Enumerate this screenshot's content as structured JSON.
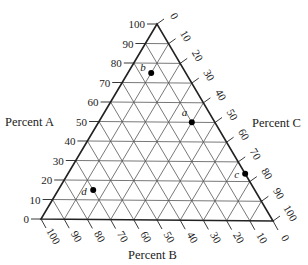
{
  "diagram": {
    "type": "ternary",
    "vertices": {
      "top": "100% A",
      "bottom_left": "100% B",
      "bottom_right": "100% C"
    },
    "axes": {
      "A": {
        "title": "Percent A",
        "ticks": [
          "0",
          "10",
          "20",
          "30",
          "40",
          "50",
          "60",
          "70",
          "80",
          "90",
          "100"
        ]
      },
      "B": {
        "title": "Percent B",
        "ticks": [
          "100",
          "90",
          "80",
          "70",
          "60",
          "50",
          "40",
          "30",
          "20",
          "10",
          "0"
        ]
      },
      "C": {
        "title": "Percent C",
        "ticks": [
          "0",
          "10",
          "20",
          "30",
          "40",
          "50",
          "60",
          "70",
          "80",
          "90",
          "100"
        ]
      }
    },
    "grid_step": 10,
    "points": [
      {
        "label": "a",
        "A": 50,
        "B": 10,
        "C": 40
      },
      {
        "label": "b",
        "A": 75,
        "B": 15,
        "C": 10
      },
      {
        "label": "c",
        "A": 24,
        "B": 0,
        "C": 76
      },
      {
        "label": "d",
        "A": 15,
        "B": 70,
        "C": 15
      }
    ],
    "colors": {
      "grid": "#555555",
      "border": "#222222",
      "point": "#000000",
      "text": "#222222"
    }
  }
}
